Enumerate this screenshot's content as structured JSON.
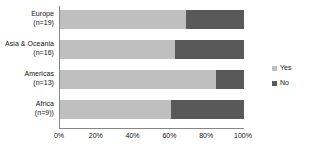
{
  "chart_data": {
    "type": "bar",
    "orientation": "horizontal",
    "stacked": true,
    "normalized": "100%",
    "title": "",
    "xlabel": "",
    "ylabel": "",
    "xlim": [
      0,
      100
    ],
    "grid": false,
    "legend_position": "right",
    "categories": [
      "Europe (n=19)",
      "Asia & Oceania (n=16)",
      "Americas (n=13)",
      "Africa (n=9))"
    ],
    "category_lines": [
      [
        "Europe",
        "(n=19)"
      ],
      [
        "Asia & Oceania",
        "(n=16)"
      ],
      [
        "Americas",
        "(n=13)"
      ],
      [
        "Africa",
        "(n=9))"
      ]
    ],
    "series": [
      {
        "name": "Yes",
        "color": "#bfbfbf",
        "values": [
          68.4,
          62.5,
          84.6,
          60.5
        ]
      },
      {
        "name": "No",
        "color": "#595959",
        "values": [
          31.6,
          37.5,
          15.4,
          39.5
        ]
      }
    ],
    "xticks": [
      "0%",
      "20%",
      "40%",
      "60%",
      "80%",
      "100%"
    ],
    "xtick_values": [
      0,
      20,
      40,
      60,
      80,
      100
    ]
  },
  "legend": {
    "items": [
      {
        "label": "Yes",
        "color": "#bfbfbf"
      },
      {
        "label": "No",
        "color": "#595959"
      }
    ]
  },
  "axis": {
    "line_color": "#868686"
  }
}
